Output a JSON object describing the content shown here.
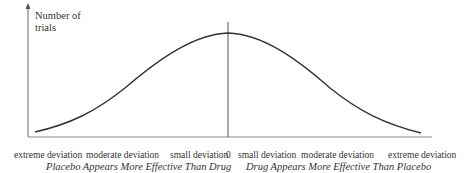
{
  "diagram": {
    "type": "normal-distribution-curve",
    "y_axis_label": "Number of trials",
    "y_axis_label_line1": "Number of",
    "y_axis_label_line2": "trials",
    "x_ticks": [
      "extreme deviation",
      "moderate deviation",
      "small deviation",
      "0",
      "small deviation",
      "moderate deviation",
      "extreme deviation"
    ],
    "left_caption": "Placebo Appears More Effective Than Drug",
    "right_caption": "Drug Appears More Effective Than Placebo",
    "line_color": "#333333"
  }
}
